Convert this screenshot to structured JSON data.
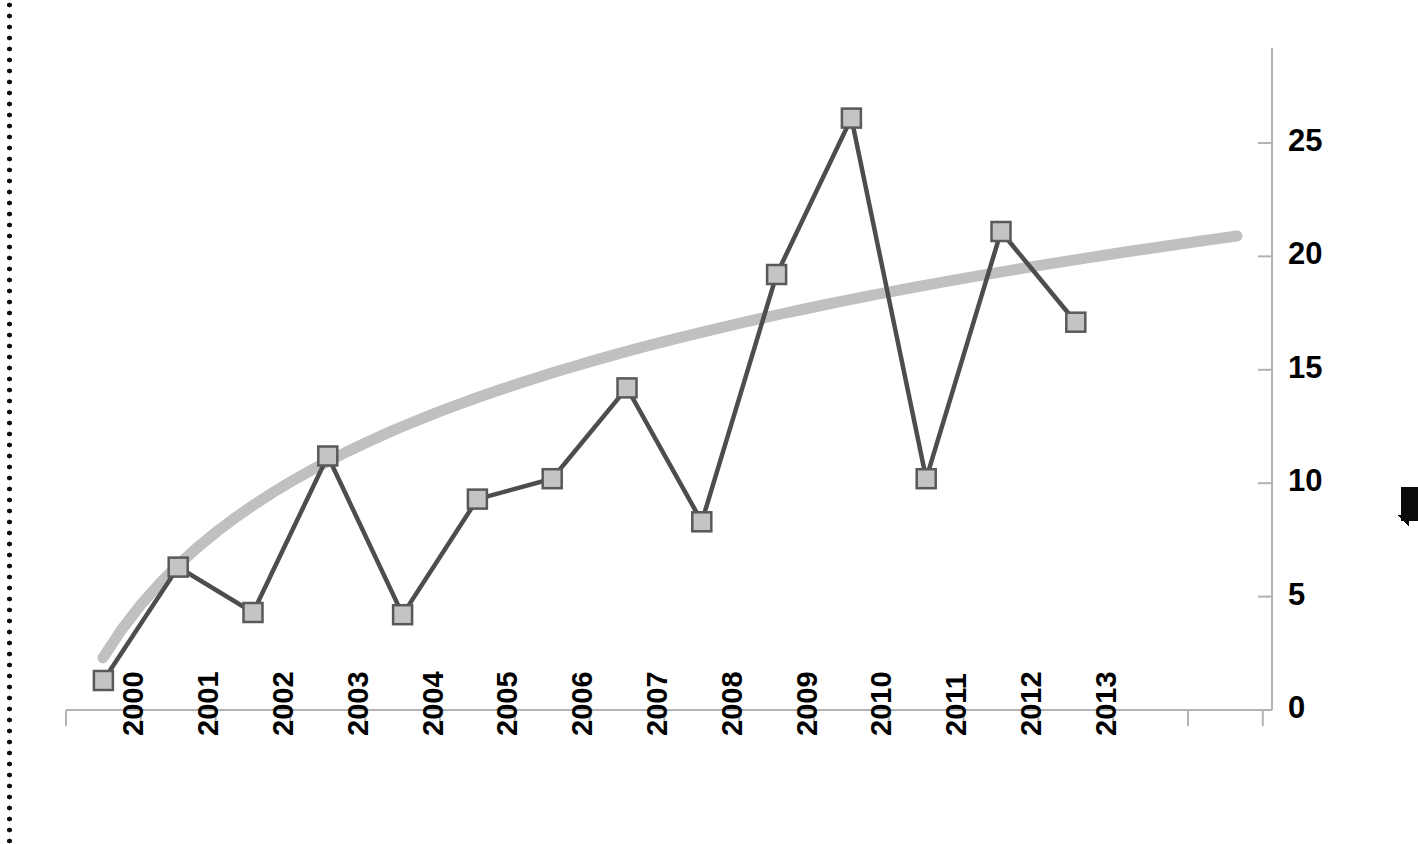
{
  "chart_data": {
    "type": "line",
    "title": "",
    "subtitle": "",
    "xlabel": "",
    "ylabel": "",
    "categories": [
      "2000",
      "2001",
      "2002",
      "2003",
      "2004",
      "2005",
      "2006",
      "2007",
      "2008",
      "2009",
      "2010",
      "2011",
      "2012",
      "2013"
    ],
    "series": [
      {
        "name": "data",
        "marker": "square",
        "marker_fill": "#c4c4c4",
        "marker_edge": "#595959",
        "line_color": "#4d4d4d",
        "values": [
          1.3,
          6.3,
          4.3,
          11.2,
          4.2,
          9.3,
          10.2,
          14.2,
          8.3,
          19.2,
          26.1,
          10.2,
          21.1,
          17.1
        ]
      },
      {
        "name": "trendline",
        "type": "logarithmic-trendline",
        "line_color": "#c0c0c0",
        "start": {
          "x": "2000",
          "y": 2.3
        },
        "end": {
          "x": "2015",
          "y": 20.9
        },
        "values": [
          2.3,
          5.6,
          7.6,
          9.0,
          10.2,
          11.2,
          12.0,
          12.8,
          13.5,
          14.1,
          14.7,
          15.2,
          15.7,
          16.2
        ]
      }
    ],
    "yticks": [
      0,
      5,
      10,
      15,
      20,
      25
    ],
    "ylim": [
      0,
      28.5
    ],
    "xticks_extra": 2,
    "grid": false,
    "legend": false,
    "x_tick_labels_rotation": -90,
    "axis_color": "#b3b3b3"
  },
  "axes": {
    "y_tick_labels": [
      "0",
      "5",
      "10",
      "15",
      "20",
      "25"
    ],
    "x_tick_labels": [
      "2000",
      "2001",
      "2002",
      "2003",
      "2004",
      "2005",
      "2006",
      "2007",
      "2008",
      "2009",
      "2010",
      "2011",
      "2012",
      "2013"
    ]
  },
  "artifacts": {
    "left_edge": "dotted-scan-edge",
    "right_mark": "black-scan-mark"
  }
}
